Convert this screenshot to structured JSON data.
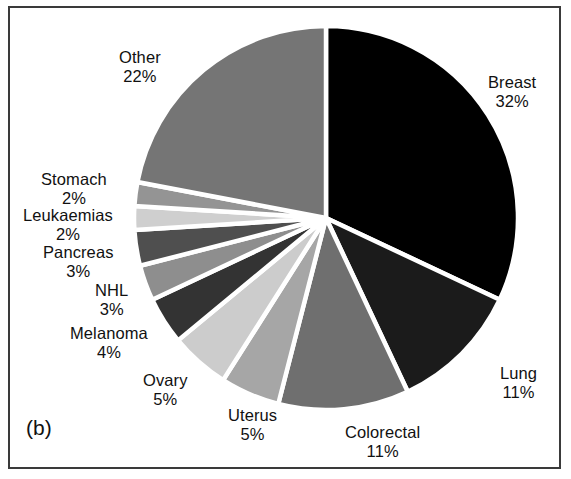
{
  "figure": {
    "panel_letter": "(b)",
    "background_color": "#ffffff",
    "frame_color": "#3a3a3a",
    "slice_separator_color": "#ffffff"
  },
  "chart_data": {
    "type": "pie",
    "title": "",
    "xlabel": "",
    "ylabel": "",
    "units": "percent",
    "start_angle_deg": 0,
    "direction": "clockwise",
    "legend_position": "none",
    "labels_position": "outside",
    "categories": [
      "Breast",
      "Lung",
      "Colorectal",
      "Uterus",
      "Ovary",
      "Melanoma",
      "NHL",
      "Pancreas",
      "Leukaemias",
      "Stomach",
      "Other"
    ],
    "values": [
      32,
      11,
      11,
      5,
      5,
      4,
      3,
      3,
      2,
      2,
      22
    ],
    "colors": [
      "#000000",
      "#1b1b1b",
      "#6f6f6f",
      "#a6a6a6",
      "#cccccc",
      "#333333",
      "#8e8e8e",
      "#4f4f4f",
      "#cfcfcf",
      "#949494",
      "#757575"
    ],
    "slices": [
      {
        "label": "Breast",
        "value": 32,
        "display_value": "32%",
        "color": "#000000"
      },
      {
        "label": "Lung",
        "value": 11,
        "display_value": "11%",
        "color": "#1b1b1b"
      },
      {
        "label": "Colorectal",
        "value": 11,
        "display_value": "11%",
        "color": "#6f6f6f"
      },
      {
        "label": "Uterus",
        "value": 5,
        "display_value": "5%",
        "color": "#a6a6a6"
      },
      {
        "label": "Ovary",
        "value": 5,
        "display_value": "5%",
        "color": "#cccccc"
      },
      {
        "label": "Melanoma",
        "value": 4,
        "display_value": "4%",
        "color": "#333333"
      },
      {
        "label": "NHL",
        "value": 3,
        "display_value": "3%",
        "color": "#8e8e8e"
      },
      {
        "label": "Pancreas",
        "value": 3,
        "display_value": "3%",
        "color": "#4f4f4f"
      },
      {
        "label": "Leukaemias",
        "value": 2,
        "display_value": "2%",
        "color": "#cfcfcf"
      },
      {
        "label": "Stomach",
        "value": 2,
        "display_value": "2%",
        "color": "#949494"
      },
      {
        "label": "Other",
        "value": 22,
        "display_value": "22%",
        "color": "#757575"
      }
    ]
  },
  "labels": {
    "breast": {
      "name": "Breast",
      "pct": "32%"
    },
    "lung": {
      "name": "Lung",
      "pct": "11%"
    },
    "colorectal": {
      "name": "Colorectal",
      "pct": "11%"
    },
    "uterus": {
      "name": "Uterus",
      "pct": "5%"
    },
    "ovary": {
      "name": "Ovary",
      "pct": "5%"
    },
    "melanoma": {
      "name": "Melanoma",
      "pct": "4%"
    },
    "nhl": {
      "name": "NHL",
      "pct": "3%"
    },
    "pancreas": {
      "name": "Pancreas",
      "pct": "3%"
    },
    "leukaemias": {
      "name": "Leukaemias",
      "pct": "2%"
    },
    "stomach": {
      "name": "Stomach",
      "pct": "2%"
    },
    "other": {
      "name": "Other",
      "pct": "22%"
    }
  }
}
